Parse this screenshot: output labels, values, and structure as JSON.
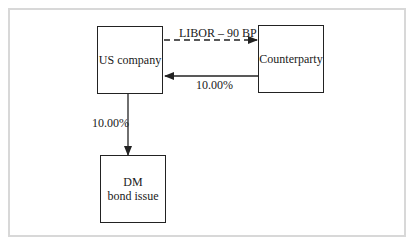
{
  "diagram": {
    "nodes": {
      "us_company": {
        "label": "US company"
      },
      "counterparty": {
        "label": "Counterparty"
      },
      "dm_bond": {
        "line1": "DM",
        "line2": "bond issue"
      }
    },
    "edges": {
      "libor": {
        "label": "LIBOR – 90 BP",
        "from": "US company",
        "to": "Counterparty",
        "style": "dashed"
      },
      "fixed_cp": {
        "label": "10.00%",
        "from": "Counterparty",
        "to": "US company",
        "style": "solid"
      },
      "fixed_bond": {
        "label": "10.00%",
        "from": "US company",
        "to": "DM bond issue",
        "style": "solid"
      }
    }
  }
}
